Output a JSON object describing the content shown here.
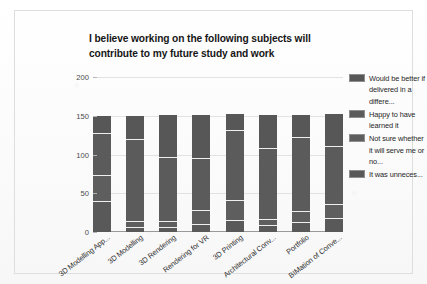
{
  "chart_data": {
    "type": "bar",
    "subtype": "stacked-bar",
    "title": "I believe working on the following subjects will contribute to my future study and work",
    "title_lines": [
      "I believe working on the following subjects will",
      "contribute to my future study and work"
    ],
    "xlabel": "",
    "ylabel": "",
    "ylim": [
      0,
      200
    ],
    "yticks": [
      0,
      50,
      100,
      150,
      200
    ],
    "ytick_labels": [
      "0",
      "50",
      "100",
      "150",
      "200"
    ],
    "grid": true,
    "grid_axis": "y",
    "legend_position": "right",
    "categories": [
      "3D Modelling App...",
      "3D Modelling",
      "3D Rendering",
      "Rendering for VR",
      "3D Printing",
      "Architectural Conv...",
      "Portfolio",
      "BIMation of Conve..."
    ],
    "series": [
      {
        "name": "It was unneces...",
        "color": "#595959",
        "values": [
          40,
          7,
          7,
          10,
          16,
          9,
          13,
          18
        ]
      },
      {
        "name": "Not sure whether it will serve me or no...",
        "color": "#5e5e5e",
        "values": [
          33,
          7,
          7,
          18,
          25,
          8,
          14,
          18
        ]
      },
      {
        "name": "Happy to have learned it",
        "color": "#5b5b5b",
        "values": [
          55,
          106,
          83,
          67,
          90,
          91,
          95,
          75
        ]
      },
      {
        "name": "Would be better if delivered in a differe...",
        "color": "#575757",
        "values": [
          22,
          30,
          54,
          56,
          21,
          43,
          29,
          41
        ]
      }
    ],
    "totals": [
      150,
      150,
      151,
      151,
      152,
      151,
      151,
      152
    ]
  },
  "legend": {
    "entries": [
      {
        "label": "Would be better if delivered in a differe...",
        "color": "#575757"
      },
      {
        "label": "Happy to have learned it",
        "color": "#5b5b5b"
      },
      {
        "label": "Not sure whether it will serve me or no...",
        "color": "#5e5e5e"
      },
      {
        "label": "It was unneces...",
        "color": "#595959"
      }
    ]
  },
  "style": {
    "background": "#fdfdfd",
    "frame_border": "#dedede",
    "gridline": "#e2e2e2",
    "axis": "#9a9a9a",
    "tick_text": "#4a4a4a",
    "label_text": "#303030",
    "title_text": "#161616"
  }
}
